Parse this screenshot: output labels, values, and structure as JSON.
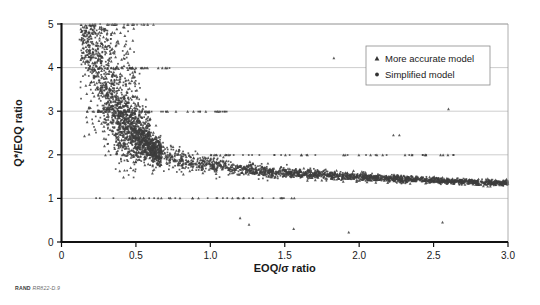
{
  "figure": {
    "source_note_org": "RAND",
    "source_note_id": "RR822-D.9"
  },
  "chart_data": {
    "type": "scatter",
    "title": "",
    "xlabel": "EOQ/σ ratio",
    "ylabel": "Q*/EOQ ratio",
    "xlim": [
      0,
      3.0
    ],
    "ylim": [
      0,
      5
    ],
    "xticks": [
      0,
      0.5,
      1.0,
      1.5,
      2.0,
      2.5,
      3.0
    ],
    "xtick_labels": [
      "0",
      "0.5",
      "1.0",
      "1.5",
      "2.0",
      "2.5",
      "3.0"
    ],
    "yticks": [
      0,
      1,
      2,
      3,
      4,
      5
    ],
    "ytick_labels": [
      "0",
      "1",
      "2",
      "3",
      "4",
      "5"
    ],
    "grid": {
      "horizontal": true,
      "vertical": false,
      "color": "#b9b9b9"
    },
    "legend": {
      "position": "top-right",
      "entries": [
        {
          "label": "More accurate model",
          "marker": "triangle",
          "color": "#333333"
        },
        {
          "label": "Simplified model",
          "marker": "dot",
          "color": "#333333"
        }
      ]
    },
    "marker_color": "#3d3d3d",
    "marker_size": 1.5,
    "series": [
      {
        "name": "More accurate model",
        "marker": "triangle",
        "n_points": 1700,
        "x_range": [
          0.1,
          3.0
        ],
        "y_range": [
          0.15,
          5.0
        ]
      },
      {
        "name": "Simplified model",
        "marker": "dot",
        "n_points": 1700,
        "x_range": [
          0.1,
          3.0
        ],
        "y_range": [
          0.15,
          5.0
        ]
      }
    ],
    "trend_points": [
      {
        "x": 0.15,
        "y": 4.6
      },
      {
        "x": 0.2,
        "y": 4.1
      },
      {
        "x": 0.25,
        "y": 3.6
      },
      {
        "x": 0.3,
        "y": 3.2
      },
      {
        "x": 0.35,
        "y": 2.9
      },
      {
        "x": 0.4,
        "y": 2.65
      },
      {
        "x": 0.5,
        "y": 2.35
      },
      {
        "x": 0.6,
        "y": 2.15
      },
      {
        "x": 0.7,
        "y": 2.0
      },
      {
        "x": 0.8,
        "y": 1.9
      },
      {
        "x": 0.9,
        "y": 1.82
      },
      {
        "x": 1.0,
        "y": 1.76
      },
      {
        "x": 1.2,
        "y": 1.68
      },
      {
        "x": 1.4,
        "y": 1.62
      },
      {
        "x": 1.6,
        "y": 1.57
      },
      {
        "x": 1.8,
        "y": 1.53
      },
      {
        "x": 2.0,
        "y": 1.5
      },
      {
        "x": 2.2,
        "y": 1.46
      },
      {
        "x": 2.4,
        "y": 1.43
      },
      {
        "x": 2.6,
        "y": 1.4
      },
      {
        "x": 2.8,
        "y": 1.37
      },
      {
        "x": 3.0,
        "y": 1.35
      }
    ],
    "outliers": [
      {
        "x": 0.13,
        "y": 4.18
      },
      {
        "x": 1.2,
        "y": 0.55
      },
      {
        "x": 1.26,
        "y": 0.4
      },
      {
        "x": 1.56,
        "y": 0.3
      },
      {
        "x": 1.83,
        "y": 4.22
      },
      {
        "x": 1.93,
        "y": 0.22
      },
      {
        "x": 2.23,
        "y": 2.45
      },
      {
        "x": 2.27,
        "y": 2.45
      },
      {
        "x": 2.56,
        "y": 0.45
      },
      {
        "x": 2.6,
        "y": 3.05
      }
    ]
  }
}
